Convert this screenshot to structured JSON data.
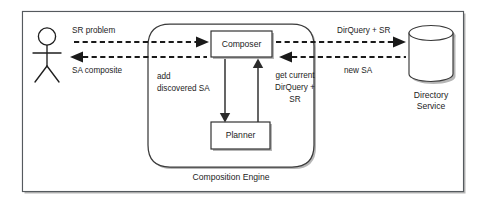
{
  "diagram": {
    "frame": {
      "name": "outer-frame"
    },
    "actor": {
      "name": "user-actor",
      "label": ""
    },
    "engine": {
      "label": "Composition Engine"
    },
    "nodes": [
      {
        "id": "composer",
        "label": "Composer"
      },
      {
        "id": "planner",
        "label": "Planner"
      },
      {
        "id": "directory",
        "label_line1": "Directory",
        "label_line2": "Service"
      }
    ],
    "flows": [
      {
        "id": "sr-problem",
        "label": "SR problem",
        "direction": "right",
        "style": "dashed"
      },
      {
        "id": "sa-composite",
        "label": "SA composite",
        "direction": "left",
        "style": "dashed"
      },
      {
        "id": "dirquery-sr",
        "label": "DirQuery + SR",
        "direction": "right",
        "style": "dashed"
      },
      {
        "id": "new-sa",
        "label": "new SA",
        "direction": "left",
        "style": "dashed"
      },
      {
        "id": "add-discovered-sa",
        "label_line1": "add",
        "label_line2": "discovered SA",
        "direction": "down",
        "style": "solid"
      },
      {
        "id": "get-current-dirquery-sr",
        "label_line1": "get current",
        "label_line2": "DirQuery +",
        "label_line3": "SR",
        "direction": "up",
        "style": "solid"
      }
    ],
    "colors": {
      "background": "#ffffff",
      "frame_stroke": "#555a5e",
      "node_stroke": "#2b2b2b",
      "shadow": "#a9a9a9",
      "text": "#1c1c1c",
      "arrow": "#1a1a1a"
    }
  }
}
